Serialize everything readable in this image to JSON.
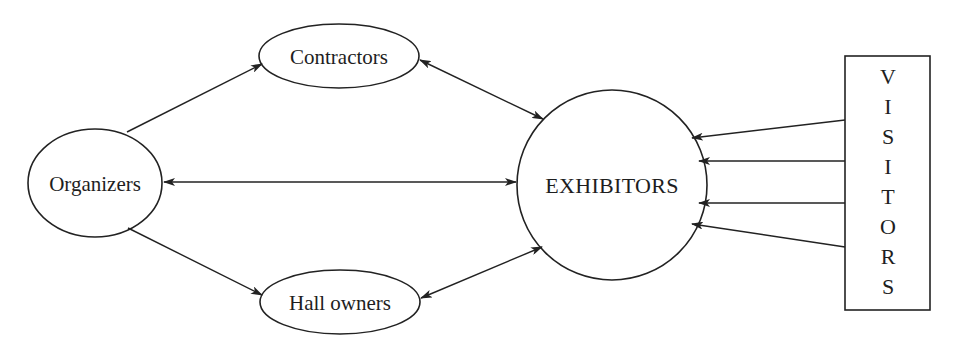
{
  "diagram": {
    "nodes": {
      "organizers": {
        "label": "Organizers",
        "shape": "ellipse"
      },
      "contractors": {
        "label": "Contractors",
        "shape": "ellipse"
      },
      "hall_owners": {
        "label": "Hall owners",
        "shape": "ellipse"
      },
      "exhibitors": {
        "label": "EXHIBITORS",
        "shape": "circle"
      },
      "visitors": {
        "label": "VISITORS",
        "shape": "rectangle",
        "letters": [
          "V",
          "I",
          "S",
          "I",
          "T",
          "O",
          "R",
          "S"
        ]
      }
    },
    "edges": [
      {
        "from": "Organizers",
        "to": "Contractors",
        "direction": "one-way"
      },
      {
        "from": "Organizers",
        "to": "Hall owners",
        "direction": "one-way"
      },
      {
        "from": "Organizers",
        "to": "EXHIBITORS",
        "direction": "two-way"
      },
      {
        "from": "Contractors",
        "to": "EXHIBITORS",
        "direction": "two-way"
      },
      {
        "from": "Hall owners",
        "to": "EXHIBITORS",
        "direction": "two-way"
      },
      {
        "from": "VISITORS",
        "to": "EXHIBITORS",
        "direction": "one-way",
        "count": 4
      }
    ],
    "colors": {
      "stroke": "#222222",
      "background": "#ffffff",
      "text": "#1e1e1e"
    }
  }
}
